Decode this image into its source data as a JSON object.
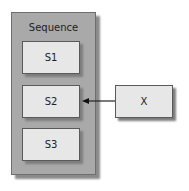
{
  "diagram": {
    "container": {
      "label": "Sequence"
    },
    "items": [
      {
        "id": "s1",
        "label": "S1"
      },
      {
        "id": "s2",
        "label": "S2"
      },
      {
        "id": "s3",
        "label": "S3"
      }
    ],
    "external": {
      "id": "x",
      "label": "X"
    },
    "edges": [
      {
        "from": "X",
        "to": "S2",
        "style": "arrow"
      }
    ],
    "colors": {
      "container_fill": "#a9a9a9",
      "box_fill": "#e7e7e7",
      "stroke": "#333333"
    }
  }
}
